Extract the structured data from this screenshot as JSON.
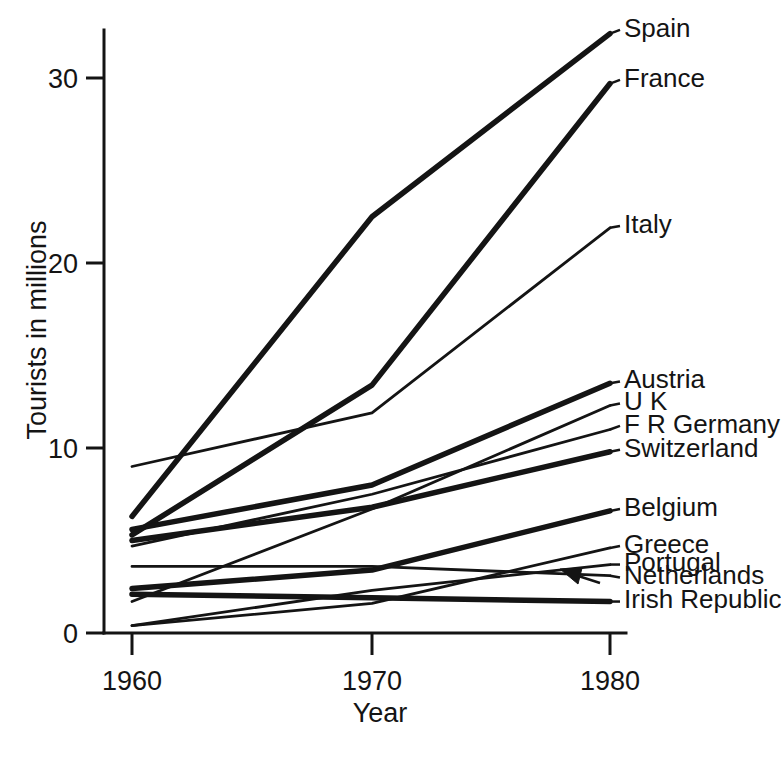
{
  "chart_data": {
    "type": "line",
    "title": "",
    "xlabel": "Year",
    "ylabel": "Tourists in millions",
    "x": [
      1960,
      1970,
      1980
    ],
    "xtick_labels": [
      "1960",
      "1970",
      "1980"
    ],
    "ytick_labels": [
      "0",
      "10",
      "20",
      "30"
    ],
    "yticks": [
      0,
      10,
      20,
      30
    ],
    "ylim": [
      0,
      33.5
    ],
    "xlim": [
      1958.5,
      1981.5
    ],
    "grid": false,
    "legend_position": "right-inline-labels",
    "units": "millions of tourists",
    "annotations": [
      {
        "text": "arrow pointing to Netherlands line end",
        "target_series": "Netherlands",
        "type": "arrow"
      }
    ],
    "series": [
      {
        "name": "Spain",
        "values": [
          6.3,
          22.5,
          32.4
        ],
        "weight": "thick"
      },
      {
        "name": "France",
        "values": [
          5.3,
          13.4,
          29.7
        ],
        "weight": "thick"
      },
      {
        "name": "Italy",
        "values": [
          9.0,
          11.9,
          21.9
        ],
        "weight": "thin"
      },
      {
        "name": "Austria",
        "values": [
          5.6,
          8.0,
          13.5
        ],
        "weight": "thick"
      },
      {
        "name": "U K",
        "values": [
          1.7,
          6.7,
          12.3
        ],
        "weight": "thin"
      },
      {
        "name": "F R Germany",
        "values": [
          4.7,
          7.5,
          11.0
        ],
        "weight": "thin"
      },
      {
        "name": "Switzerland",
        "values": [
          5.0,
          6.8,
          9.8
        ],
        "weight": "thick"
      },
      {
        "name": "Belgium",
        "values": [
          2.4,
          3.4,
          6.6
        ],
        "weight": "thick"
      },
      {
        "name": "Greece",
        "values": [
          0.4,
          1.6,
          4.6
        ],
        "weight": "thin"
      },
      {
        "name": "Portugal",
        "values": [
          0.4,
          2.3,
          3.7
        ],
        "weight": "thin"
      },
      {
        "name": "Netherlands",
        "values": [
          3.6,
          3.6,
          3.1
        ],
        "weight": "thin"
      },
      {
        "name": "Irish Republic",
        "values": [
          2.1,
          1.9,
          1.7
        ],
        "weight": "thick"
      }
    ]
  },
  "labels": {
    "right_labels": [
      {
        "name": "Spain",
        "y_value": 32.4,
        "label_y": 32.6
      },
      {
        "name": "France",
        "y_value": 29.7,
        "label_y": 29.9
      },
      {
        "name": "Italy",
        "y_value": 21.9,
        "label_y": 22.0
      },
      {
        "name": "Austria",
        "y_value": 13.5,
        "label_y": 13.6
      },
      {
        "name": "U K",
        "y_value": 12.3,
        "label_y": 12.4
      },
      {
        "name": "F R Germany",
        "y_value": 11.0,
        "label_y": 11.2
      },
      {
        "name": "Switzerland",
        "y_value": 9.8,
        "label_y": 9.9
      },
      {
        "name": "Belgium",
        "y_value": 6.6,
        "label_y": 6.7
      },
      {
        "name": "Greece",
        "y_value": 4.6,
        "label_y": 4.7
      },
      {
        "name": "Portugal",
        "y_value": 3.7,
        "label_y": 3.7
      },
      {
        "name": "Netherlands",
        "y_value": 3.1,
        "label_y": 3.0
      },
      {
        "name": "Irish Republic",
        "y_value": 1.7,
        "label_y": 1.7
      }
    ]
  },
  "axes": {
    "y_title": "Tourists in millions",
    "x_title": "Year",
    "y_ticks": [
      "30",
      "20",
      "10",
      "0"
    ],
    "x_ticks": [
      "1960",
      "1970",
      "1980"
    ]
  }
}
